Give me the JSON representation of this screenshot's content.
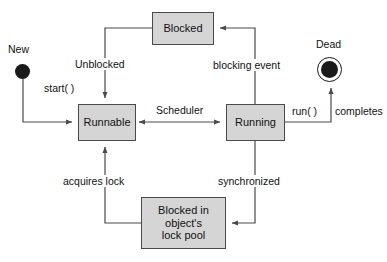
{
  "diagram": {
    "type": "state-machine",
    "colors": {
      "state_fill": "#d5d5d5",
      "state_border": "#4a4a4a",
      "line": "#4a4a4a",
      "text": "#111111",
      "background": "#ffffff",
      "pseudo_state": "#1a1a1a"
    },
    "states": [
      {
        "id": "blocked",
        "label": "Blocked",
        "x": 152,
        "y": 12,
        "w": 62,
        "h": 33
      },
      {
        "id": "runnable",
        "label": "Runnable",
        "x": 78,
        "y": 104,
        "w": 58,
        "h": 37
      },
      {
        "id": "running",
        "label": "Running",
        "x": 226,
        "y": 104,
        "w": 59,
        "h": 37
      },
      {
        "id": "lockpool",
        "line1": "Blocked in",
        "line2": "object's",
        "line3": "lock pool",
        "x": 141,
        "y": 197,
        "w": 85,
        "h": 52
      }
    ],
    "pseudo_states": [
      {
        "id": "new",
        "label": "New",
        "kind": "initial",
        "cx": 23,
        "cy": 72
      },
      {
        "id": "dead",
        "label": "Dead",
        "kind": "final",
        "cx": 330,
        "cy": 70
      }
    ],
    "transitions": [
      {
        "id": "start",
        "label": "start( )",
        "from": "new",
        "to": "runnable"
      },
      {
        "id": "unblocked",
        "label": "Unblocked",
        "from": "blocked",
        "to": "runnable"
      },
      {
        "id": "scheduler",
        "label": "Scheduler",
        "from": "runnable",
        "to": "running",
        "bidirectional": true
      },
      {
        "id": "blockingevt",
        "label": "blocking event",
        "from": "running",
        "to": "blocked"
      },
      {
        "id": "runcompletes_a",
        "label": "run( )",
        "from": "running",
        "to": "dead"
      },
      {
        "id": "runcompletes_b",
        "label": "completes",
        "from": "running",
        "to": "dead"
      },
      {
        "id": "synchronized",
        "label": "synchronized",
        "from": "running",
        "to": "lockpool"
      },
      {
        "id": "acquireslock",
        "label": "acquires lock",
        "from": "lockpool",
        "to": "runnable"
      }
    ]
  }
}
